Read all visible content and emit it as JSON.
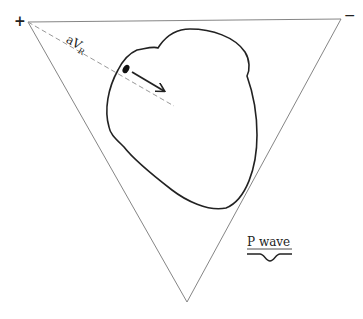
{
  "diagram": {
    "type": "einthoven-triangle-vector",
    "polarity": {
      "positive": "+",
      "negative": "−"
    },
    "lead_label": {
      "main": "aV",
      "subscript": "R"
    },
    "wave_label": "P wave",
    "colors": {
      "stroke": "#222222",
      "triangle": "#777777",
      "dashed": "#999999"
    },
    "triangle_vertices": [
      [
        28,
        22
      ],
      [
        341,
        19
      ],
      [
        187,
        302
      ]
    ]
  }
}
